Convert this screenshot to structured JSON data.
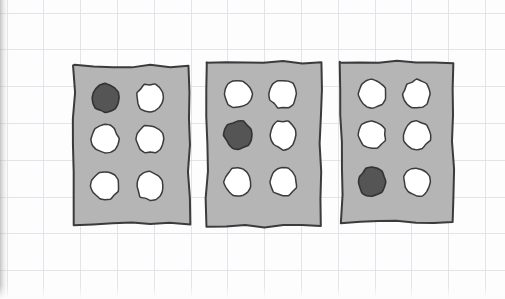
{
  "scene": {
    "title": "Hand-drawn graph-paper sketch of three perforated cards",
    "medium": "pencil sketch on grid/graph paper",
    "canvas": {
      "width": 505,
      "height": 299
    },
    "background": {
      "name": "graph-paper",
      "paper_color": "#fdfdfd",
      "grid_color": "#d9dde2",
      "grid_spacing_px": 36.8,
      "grid_origin": {
        "x": 7,
        "y": 13
      },
      "left_edge_shadow": true
    },
    "palette": {
      "card_fill": "#b5b5b5",
      "card_outline": "#3b3b3b",
      "hole_fill": "#ffffff",
      "hole_outline": "#3b3b3b",
      "marked_fill": "#555555",
      "marked_outline": "#333333"
    },
    "layout": {
      "card_count": 3,
      "rows_per_card": 3,
      "columns_per_card": 2,
      "holes_per_card": 6,
      "marked_per_card": 1
    },
    "cards": [
      {
        "id": "card-1",
        "label": "Card 1",
        "x": 74,
        "y": 66,
        "width": 115,
        "height": 158,
        "marked_row": 1,
        "marked_column": 1,
        "marked_position": "top-left",
        "holes": [
          {
            "row": 1,
            "column": 1,
            "state": "marked"
          },
          {
            "row": 1,
            "column": 2,
            "state": "open"
          },
          {
            "row": 2,
            "column": 1,
            "state": "open"
          },
          {
            "row": 2,
            "column": 2,
            "state": "open"
          },
          {
            "row": 3,
            "column": 1,
            "state": "open"
          },
          {
            "row": 3,
            "column": 2,
            "state": "open"
          }
        ]
      },
      {
        "id": "card-2",
        "label": "Card 2",
        "x": 207,
        "y": 62,
        "width": 114,
        "height": 164,
        "marked_row": 2,
        "marked_column": 1,
        "marked_position": "middle-left",
        "holes": [
          {
            "row": 1,
            "column": 1,
            "state": "open"
          },
          {
            "row": 1,
            "column": 2,
            "state": "open"
          },
          {
            "row": 2,
            "column": 1,
            "state": "marked"
          },
          {
            "row": 2,
            "column": 2,
            "state": "open"
          },
          {
            "row": 3,
            "column": 1,
            "state": "open"
          },
          {
            "row": 3,
            "column": 2,
            "state": "open"
          }
        ]
      },
      {
        "id": "card-3",
        "label": "Card 3",
        "x": 341,
        "y": 62,
        "width": 112,
        "height": 160,
        "marked_row": 3,
        "marked_column": 1,
        "marked_position": "bottom-left",
        "holes": [
          {
            "row": 1,
            "column": 1,
            "state": "open"
          },
          {
            "row": 1,
            "column": 2,
            "state": "open"
          },
          {
            "row": 2,
            "column": 1,
            "state": "open"
          },
          {
            "row": 2,
            "column": 2,
            "state": "open"
          },
          {
            "row": 3,
            "column": 1,
            "state": "marked"
          },
          {
            "row": 3,
            "column": 2,
            "state": "open"
          }
        ]
      }
    ],
    "hole_geometry": {
      "diameter_px": 27,
      "column_centers_rel": [
        31,
        76
      ],
      "row_centers_rel": [
        32,
        73,
        120
      ]
    }
  }
}
